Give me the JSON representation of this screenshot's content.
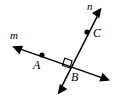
{
  "figure": {
    "background_color": "#ffffff",
    "stroke_color": "#000000",
    "width": 116,
    "height": 108,
    "labels": {
      "line_m": "m",
      "line_n": "n",
      "point_a": "A",
      "point_b": "B",
      "point_c": "C"
    },
    "lines": [
      {
        "name": "m",
        "label": "m",
        "type": "double-headed-arrow",
        "start": [
          14,
          47
        ],
        "end": [
          108,
          80
        ],
        "label_position": [
          10,
          30
        ]
      },
      {
        "name": "n",
        "label": "n",
        "type": "double-headed-arrow",
        "start": [
          101,
          9
        ],
        "end": [
          58,
          94
        ],
        "label_position": [
          87,
          1
        ]
      }
    ],
    "points": [
      {
        "label": "A",
        "on_line": "m",
        "x": 42,
        "y": 55,
        "marker": "filled-dot",
        "label_position": [
          33,
          59
        ]
      },
      {
        "label": "B",
        "on_line": "m,n",
        "x": 70,
        "y": 68,
        "marker": "intersection",
        "label_position": [
          71,
          71
        ]
      },
      {
        "label": "C",
        "on_line": "n",
        "x": 87,
        "y": 32,
        "marker": "filled-dot",
        "label_position": [
          93,
          27
        ]
      }
    ],
    "angle_markers": [
      {
        "at_point": "B",
        "type": "right-angle-square",
        "measure_degrees": 90
      }
    ]
  }
}
